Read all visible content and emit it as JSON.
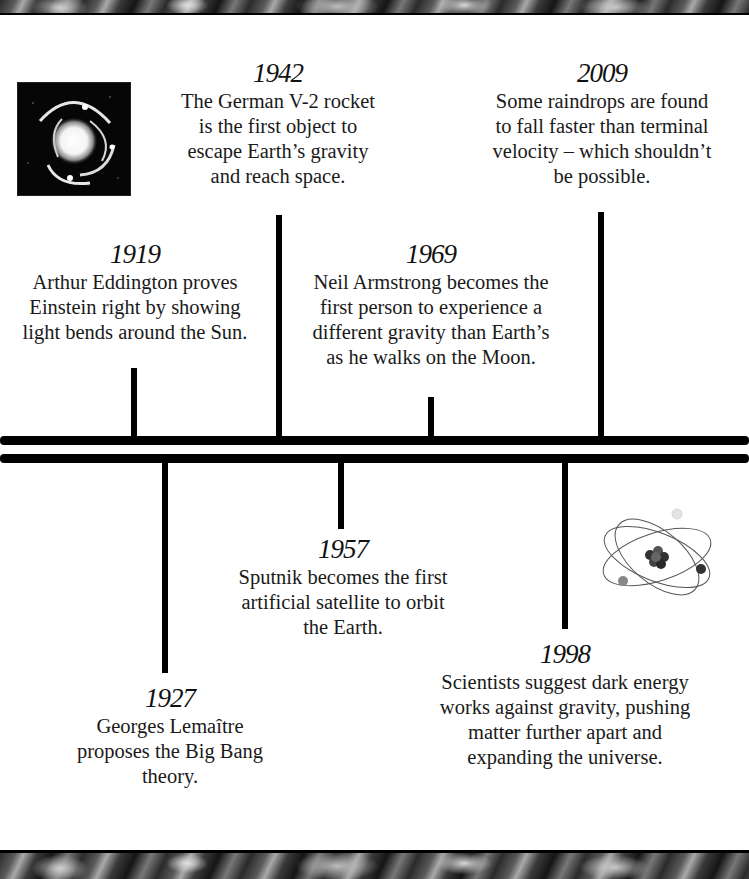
{
  "layout": {
    "top_band": "space-photo-strip",
    "bottom_band": "space-photo-strip"
  },
  "images": {
    "top_left": {
      "icon": "gravitational-lens-image",
      "description": "Einstein ring / lensed galaxy photo"
    },
    "bottom_right": {
      "icon": "atom-icon",
      "description": "atom with nucleus and three orbiting electrons"
    }
  },
  "timeline": {
    "above": [
      {
        "year": "1919",
        "text": "Arthur Eddington proves\nEinstein right by showing\nlight bends around the Sun."
      },
      {
        "year": "1942",
        "text": "The German V-2 rocket\nis the first object to\nescape Earth’s gravity\nand reach space."
      },
      {
        "year": "1969",
        "text": "Neil Armstrong becomes the\nfirst person to experience a\ndifferent gravity than Earth’s\nas he walks on the Moon."
      },
      {
        "year": "2009",
        "text": "Some raindrops are found\nto fall faster than terminal\nvelocity – which shouldn’t\nbe possible."
      }
    ],
    "below": [
      {
        "year": "1927",
        "text": "Georges Lemaître\nproposes the Big Bang\ntheory."
      },
      {
        "year": "1957",
        "text": "Sputnik becomes the first\nartificial satellite to orbit\nthe Earth."
      },
      {
        "year": "1998",
        "text": "Scientists suggest dark energy\nworks against gravity, pushing\nmatter further apart and\nexpanding the universe."
      }
    ]
  },
  "colors": {
    "background": "#ffffff",
    "line": "#000000",
    "text": "#1a1a1a"
  }
}
